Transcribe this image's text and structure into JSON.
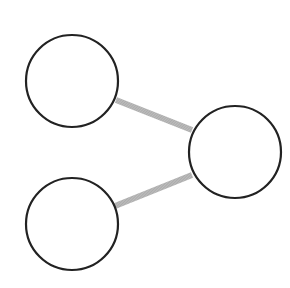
{
  "diagram": {
    "type": "node-graph",
    "colors": {
      "background": "#ffffff",
      "node_stroke": "#222222",
      "node_fill": "#ffffff",
      "edge": "#a8a8a8"
    },
    "nodes": [
      {
        "id": "top-left",
        "cx": 72,
        "cy": 81,
        "r": 46
      },
      {
        "id": "right",
        "cx": 235,
        "cy": 152,
        "r": 46
      },
      {
        "id": "bottom-left",
        "cx": 72,
        "cy": 224,
        "r": 46
      }
    ],
    "edges": [
      {
        "from": "top-left",
        "to": "right",
        "x1": 116,
        "y1": 100,
        "x2": 192,
        "y2": 130
      },
      {
        "from": "bottom-left",
        "to": "right",
        "x1": 115,
        "y1": 206,
        "x2": 192,
        "y2": 175
      }
    ]
  }
}
